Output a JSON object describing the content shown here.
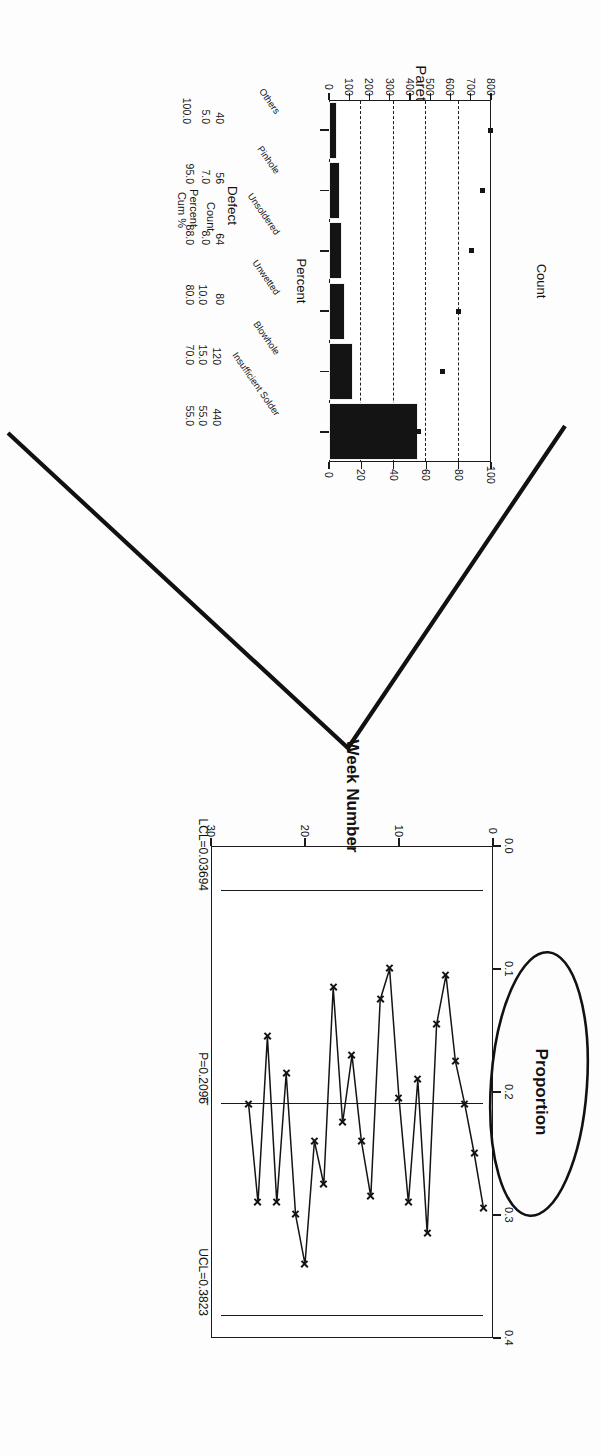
{
  "page": {
    "background": "#fdfdfd",
    "ink": "#141414",
    "orientation": "rotated-180"
  },
  "annotations": {
    "chevron": {
      "name": "hand-drawn-chevron-mark",
      "color": "#111111"
    },
    "ellipse": {
      "name": "hand-drawn-ellipse-around-proportion-label",
      "color": "#111111"
    }
  },
  "pareto": {
    "title": "Pareto Chart of Solder Defects",
    "left_axis_title": "Count",
    "right_axis_title": "Percent",
    "count_ticks": [
      "0",
      "100",
      "200",
      "300",
      "400",
      "500",
      "600",
      "700",
      "800"
    ],
    "percent_ticks": [
      "0",
      "20",
      "40",
      "60",
      "80",
      "100"
    ],
    "row_headers": {
      "defect": "Defect",
      "count": "Count",
      "percent": "Percent",
      "cum": "Cum %"
    }
  },
  "pchart": {
    "x_axis_title": "Week Number",
    "y_axis_title": "Proportion",
    "x_ticks": [
      "0",
      "10",
      "20",
      "30"
    ],
    "y_ticks": [
      "0.0",
      "0.1",
      "0.2",
      "0.3",
      "0.4"
    ],
    "ucl_label": "UCL=0.3823",
    "center_label": "P=0.2096",
    "center_bar": "_",
    "lcl_label": "LCL=0.03694"
  },
  "chart_data": [
    {
      "type": "bar",
      "name": "pareto-chart-of-solder-defects",
      "title": "Pareto Chart of Solder Defects",
      "xlabel": "Defect",
      "ylabel": "Count",
      "y2label": "Percent",
      "ylim": [
        0,
        800
      ],
      "y2lim": [
        0,
        100
      ],
      "grid": "vertical-dashed-on-percent-axis",
      "legend": "none",
      "categories": [
        "Insufficient Solder",
        "Blowhole",
        "Unwetted",
        "Unsoldered",
        "Pinhole",
        "Others"
      ],
      "values": [
        440,
        120,
        80,
        64,
        56,
        40
      ],
      "percent": [
        55.0,
        15.0,
        10.0,
        8.0,
        7.0,
        5.0
      ],
      "cumulative_percent": [
        55.0,
        70.0,
        80.0,
        88.0,
        95.0,
        100.0
      ],
      "total_count": 800,
      "table": {
        "row_labels": [
          "Defect",
          "Count",
          "Percent",
          "Cum %"
        ],
        "rows": [
          [
            "Insufficient Solder",
            "440",
            "55.0",
            "55.0"
          ],
          [
            "Blowhole",
            "120",
            "15.0",
            "70.0"
          ],
          [
            "Unsoldered",
            "80",
            "10.0",
            "80.0"
          ],
          [
            "Unwetted",
            "64",
            "8.0",
            "88.0"
          ],
          [
            "Pinhole",
            "56",
            "7.0",
            "95.0"
          ],
          [
            "Others",
            "40",
            "5.0",
            "100.0"
          ]
        ]
      }
    },
    {
      "type": "line",
      "name": "p-chart-of-proportion-defective",
      "title": "",
      "xlabel": "Week Number",
      "ylabel": "Proportion",
      "xlim": [
        0,
        30
      ],
      "ylim": [
        0.0,
        0.4
      ],
      "grid": false,
      "legend": "none",
      "marker": "x",
      "x": [
        1,
        2,
        3,
        4,
        5,
        6,
        7,
        8,
        9,
        10,
        11,
        12,
        13,
        14,
        15,
        16,
        17,
        18,
        19,
        20,
        21,
        22,
        23,
        24,
        25,
        26
      ],
      "values": [
        0.295,
        0.25,
        0.21,
        0.175,
        0.105,
        0.145,
        0.315,
        0.19,
        0.29,
        0.205,
        0.1,
        0.125,
        0.285,
        0.24,
        0.17,
        0.225,
        0.115,
        0.275,
        0.24,
        0.34,
        0.3,
        0.185,
        0.29,
        0.155,
        0.29,
        0.21
      ],
      "control_limits": {
        "ucl": 0.3823,
        "center": 0.2096,
        "lcl": 0.03694,
        "ucl_label": "UCL=0.3823",
        "center_label": "P=0.2096",
        "lcl_label": "LCL=0.03694"
      }
    }
  ]
}
